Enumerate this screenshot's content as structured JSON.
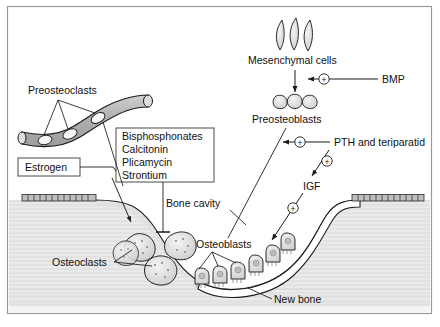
{
  "figure": {
    "frame_color": "#9a9a9a",
    "background": "#ffffff"
  },
  "labels": {
    "preosteoclasts": "Preosteoclasts",
    "estrogen": "Estrogen",
    "mesenchymal_cells": "Mesenchymal cells",
    "bmp": "BMP",
    "preosteoblasts": "Preosteoblasts",
    "pth": "PTH and teriparatid",
    "igf": "IGF",
    "bone_cavity": "Bone cavity",
    "osteoclasts": "Osteoclasts",
    "osteoblasts": "Osteoblasts",
    "new_bone": "New bone"
  },
  "drug_box": {
    "items": [
      "Bisphosphonates",
      "Calcitonin",
      "Plicamycin",
      "Strontium"
    ]
  },
  "signs": {
    "plus": "+",
    "bmp_plus": "+",
    "pth_plus": "+",
    "igf_plus": "+",
    "osteoblast_plus": "+"
  },
  "colors": {
    "vessel_fill": "#b4b4b4",
    "bone_fill": "#e8e8e8",
    "cavity_fill": "#f2f2f2",
    "cell_fill": "#d8d8d8",
    "cell_light": "#f0f0f0",
    "stroke": "#1a1a1a",
    "new_bone_fill": "#ffffff"
  },
  "counts": {
    "preosteoclast_cells": 3,
    "mesenchymal_cells": 3,
    "preosteoblast_cells": 3,
    "osteoclast_cells": 4,
    "osteoblast_cells": 6
  }
}
